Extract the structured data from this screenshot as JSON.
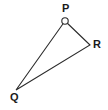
{
  "figure": {
    "type": "geometry-diagram",
    "shape": "triangle",
    "background_color": "#ffffff",
    "stroke_color": "#2b2b2b",
    "stroke_width": 1.1,
    "label_color": "#1a1a1a",
    "canvas": {
      "width": 108,
      "height": 110
    },
    "vertices": [
      {
        "id": "P",
        "label": "P",
        "x": 65,
        "y": 21,
        "marker": "open-circle",
        "marker_radius": 3.2,
        "label_x": 62,
        "label_y": 3
      },
      {
        "id": "R",
        "label": "R",
        "x": 90,
        "y": 45,
        "marker": "none",
        "marker_radius": 0,
        "label_x": 93,
        "label_y": 39
      },
      {
        "id": "Q",
        "label": "Q",
        "x": 16,
        "y": 90,
        "marker": "none",
        "marker_radius": 0,
        "label_x": 10,
        "label_y": 92
      }
    ],
    "edges": [
      {
        "id": "PR",
        "from": "P",
        "to": "R"
      },
      {
        "id": "RQ",
        "from": "R",
        "to": "Q"
      },
      {
        "id": "QP",
        "from": "Q",
        "to": "P"
      }
    ],
    "path_d": "M 65 21 L 90 45 L 16 90 Z"
  }
}
